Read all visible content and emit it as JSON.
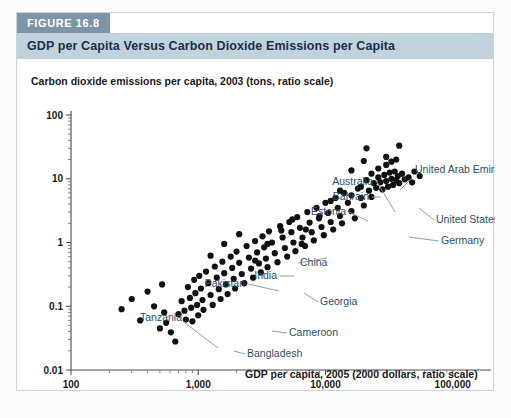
{
  "figure": {
    "tab_label": "FIGURE 16.8",
    "title": "GDP per Capita Versus Carbon Dioxide Emissions per Capita"
  },
  "colors": {
    "tab_bg": "#7d95a6",
    "title_bg": "#c2d2dd",
    "title_text": "#17314a",
    "annotation_text": "#2d5066",
    "dot": "#111111",
    "axis": "#4a4a4a",
    "card_border": "#c9d4dc",
    "page_bg": "#fbfbfa"
  },
  "chart_data": {
    "type": "scatter",
    "title": "GDP per Capita Versus Carbon Dioxide Emissions per Capita",
    "xlabel": "GDP per capita, 2005 (2000 dollars, ratio scale)",
    "ylabel": "Carbon dioxide emissions per capita, 2003 (tons, ratio scale)",
    "xscale": "log",
    "yscale": "log",
    "xlim": [
      100,
      200000
    ],
    "ylim": [
      0.01,
      100
    ],
    "xticks": [
      100,
      1000,
      10000,
      100000
    ],
    "xticklabels": [
      "100",
      "1,000",
      "10,000",
      "100,000"
    ],
    "yticks": [
      0.01,
      0.1,
      1,
      10,
      100
    ],
    "yticklabels": [
      "0.01",
      "0.1",
      "1",
      "10",
      "100"
    ],
    "grid": false,
    "legend": "none",
    "minor_ticks": true,
    "points": [
      [
        560,
        0.055
      ],
      [
        610,
        0.039
      ],
      [
        660,
        0.028
      ],
      [
        700,
        0.075
      ],
      [
        740,
        0.12
      ],
      [
        780,
        0.085
      ],
      [
        800,
        0.062
      ],
      [
        830,
        0.2
      ],
      [
        860,
        0.135
      ],
      [
        880,
        0.095
      ],
      [
        900,
        0.058
      ],
      [
        930,
        0.26
      ],
      [
        950,
        0.16
      ],
      [
        980,
        0.105
      ],
      [
        1000,
        0.072
      ],
      [
        1020,
        0.3
      ],
      [
        1050,
        0.19
      ],
      [
        1080,
        0.125
      ],
      [
        1100,
        0.088
      ],
      [
        1150,
        0.35
      ],
      [
        1200,
        0.23
      ],
      [
        1250,
        0.15
      ],
      [
        1300,
        0.105
      ],
      [
        1350,
        0.42
      ],
      [
        1400,
        0.28
      ],
      [
        1450,
        0.185
      ],
      [
        1500,
        0.13
      ],
      [
        1550,
        0.5
      ],
      [
        1600,
        0.33
      ],
      [
        1650,
        0.22
      ],
      [
        1700,
        0.155
      ],
      [
        1800,
        0.6
      ],
      [
        1850,
        0.4
      ],
      [
        1900,
        0.27
      ],
      [
        1950,
        0.19
      ],
      [
        2000,
        0.72
      ],
      [
        2100,
        0.48
      ],
      [
        2200,
        0.32
      ],
      [
        2300,
        0.23
      ],
      [
        2400,
        0.88
      ],
      [
        2500,
        0.58
      ],
      [
        2600,
        0.39
      ],
      [
        2700,
        0.28
      ],
      [
        2800,
        1.05
      ],
      [
        2900,
        0.7
      ],
      [
        3000,
        0.47
      ],
      [
        3100,
        0.34
      ],
      [
        3200,
        1.25
      ],
      [
        3300,
        0.84
      ],
      [
        3400,
        0.56
      ],
      [
        3500,
        0.41
      ],
      [
        3600,
        1.5
      ],
      [
        3800,
        1.0
      ],
      [
        4000,
        0.68
      ],
      [
        4200,
        0.49
      ],
      [
        4400,
        1.8
      ],
      [
        4600,
        1.2
      ],
      [
        4800,
        0.82
      ],
      [
        5000,
        0.6
      ],
      [
        5200,
        2.1
      ],
      [
        5400,
        1.45
      ],
      [
        5600,
        1.0
      ],
      [
        5800,
        0.73
      ],
      [
        6000,
        2.5
      ],
      [
        6300,
        1.7
      ],
      [
        6600,
        1.2
      ],
      [
        6900,
        0.88
      ],
      [
        7200,
        3.0
      ],
      [
        7500,
        2.05
      ],
      [
        7800,
        1.45
      ],
      [
        8100,
        1.08
      ],
      [
        8500,
        3.5
      ],
      [
        8900,
        2.4
      ],
      [
        9300,
        1.75
      ],
      [
        9700,
        1.3
      ],
      [
        10000,
        4.2
      ],
      [
        10500,
        2.9
      ],
      [
        11000,
        2.1
      ],
      [
        11500,
        1.6
      ],
      [
        12000,
        5.0
      ],
      [
        12500,
        3.5
      ],
      [
        13000,
        2.6
      ],
      [
        13500,
        2.0
      ],
      [
        14000,
        6.0
      ],
      [
        15000,
        4.2
      ],
      [
        16000,
        3.1
      ],
      [
        17000,
        2.4
      ],
      [
        18000,
        7.0
      ],
      [
        19000,
        5.0
      ],
      [
        20000,
        3.8
      ],
      [
        21000,
        9.5
      ],
      [
        22000,
        6.5
      ],
      [
        23000,
        5.2
      ],
      [
        24000,
        8.5
      ],
      [
        25000,
        7.2
      ],
      [
        26000,
        10.5
      ],
      [
        27000,
        8.8
      ],
      [
        28000,
        6.8
      ],
      [
        29000,
        11.5
      ],
      [
        30000,
        9.2
      ],
      [
        31000,
        7.5
      ],
      [
        32000,
        12.5
      ],
      [
        33000,
        10.0
      ],
      [
        34000,
        8.0
      ],
      [
        35000,
        13.0
      ],
      [
        36000,
        9.5
      ],
      [
        37000,
        11.0
      ],
      [
        38000,
        8.5
      ],
      [
        40000,
        12.0
      ],
      [
        42000,
        9.8
      ],
      [
        45000,
        10.5
      ],
      [
        48000,
        8.8
      ],
      [
        250,
        0.09
      ],
      [
        300,
        0.13
      ],
      [
        350,
        0.06
      ],
      [
        400,
        0.17
      ],
      [
        450,
        0.1
      ],
      [
        500,
        0.045
      ],
      [
        520,
        0.22
      ],
      [
        540,
        0.08
      ],
      [
        1250,
        0.62
      ],
      [
        1600,
        0.95
      ],
      [
        2100,
        1.35
      ],
      [
        2800,
        0.52
      ],
      [
        3500,
        0.95
      ],
      [
        4500,
        1.55
      ],
      [
        5500,
        2.3
      ],
      [
        6500,
        0.95
      ],
      [
        7000,
        1.6
      ],
      [
        9000,
        2.6
      ],
      [
        11000,
        4.5
      ],
      [
        13000,
        6.5
      ],
      [
        16000,
        5.5
      ],
      [
        19000,
        7.5
      ],
      [
        23000,
        12.0
      ],
      [
        26000,
        14.5
      ],
      [
        30000,
        16.5
      ],
      [
        33000,
        18.5
      ],
      [
        36000,
        20.0
      ],
      [
        30000,
        22.0
      ],
      [
        20000,
        19.0
      ],
      [
        16000,
        13.5
      ],
      [
        21000,
        30.0
      ],
      [
        38000,
        33.0
      ],
      [
        50000,
        13.0
      ],
      [
        55000,
        11.0
      ]
    ],
    "annotations": [
      {
        "label": "United Arab Emirates",
        "x": 30000,
        "y": 35.0,
        "text_x": 398,
        "text_y": 113,
        "anchor": "start",
        "leader": [
          [
            395,
            118
          ],
          [
            383,
            130
          ]
        ]
      },
      {
        "label": "Australia",
        "x": 32000,
        "y": 17.5,
        "text_x": 356,
        "text_y": 125,
        "anchor": "end",
        "leader": [
          [
            360,
            122
          ],
          [
            378,
            152
          ]
        ]
      },
      {
        "label": "Bahrain",
        "x": 21000,
        "y": 29.5,
        "text_x": 352,
        "text_y": 140,
        "anchor": "end",
        "leader": [
          [
            355,
            137
          ],
          [
            364,
            137
          ]
        ]
      },
      {
        "label": "Estonia",
        "x": 11500,
        "y": 12.5,
        "text_x": 329,
        "text_y": 155,
        "anchor": "end",
        "leader": [
          [
            332,
            152
          ],
          [
            351,
            161
          ]
        ]
      },
      {
        "label": "United States",
        "x": 38000,
        "y": 19.5,
        "text_x": 419,
        "text_y": 163,
        "anchor": "start",
        "leader": [
          [
            417,
            160
          ],
          [
            402,
            148
          ]
        ]
      },
      {
        "label": "Germany",
        "x": 28000,
        "y": 10.0,
        "text_x": 424,
        "text_y": 184,
        "anchor": "start",
        "leader": [
          [
            422,
            181
          ],
          [
            392,
            177
          ]
        ]
      },
      {
        "label": "China",
        "x": 5500,
        "y": 3.2,
        "text_x": 283,
        "text_y": 206,
        "anchor": "start",
        "leader": [
          [
            281,
            203
          ],
          [
            310,
            198
          ]
        ]
      },
      {
        "label": "India",
        "x": 2900,
        "y": 1.2,
        "text_x": 260,
        "text_y": 219,
        "anchor": "end",
        "leader": [
          [
            263,
            216
          ],
          [
            277,
            216
          ]
        ]
      },
      {
        "label": "Pakistan",
        "x": 2300,
        "y": 0.85,
        "text_x": 228,
        "text_y": 227,
        "anchor": "end",
        "leader": [
          [
            231,
            224
          ],
          [
            262,
            231
          ]
        ]
      },
      {
        "label": "Georgia",
        "x": 3300,
        "y": 1.05,
        "text_x": 303,
        "text_y": 245,
        "anchor": "start",
        "leader": [
          [
            301,
            242
          ],
          [
            287,
            233
          ]
        ]
      },
      {
        "label": "Cameroon",
        "x": 1900,
        "y": 0.25,
        "text_x": 272,
        "text_y": 276,
        "anchor": "start",
        "leader": [
          [
            270,
            273
          ],
          [
            255,
            271
          ]
        ]
      },
      {
        "label": "Tanzania",
        "x": 800,
        "y": 0.09,
        "text_x": 165,
        "text_y": 261,
        "anchor": "end",
        "leader": [
          [
            168,
            263
          ],
          [
            201,
            288
          ]
        ]
      },
      {
        "label": "Bangladesh",
        "x": 1700,
        "y": 0.135,
        "text_x": 230,
        "text_y": 297,
        "anchor": "start",
        "leader": [
          [
            228,
            294
          ],
          [
            217,
            291
          ]
        ]
      }
    ]
  }
}
